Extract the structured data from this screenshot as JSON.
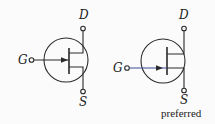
{
  "symbols": [
    {
      "id": "jfet-centered-gate",
      "terminals": {
        "drain": "D",
        "gate": "G",
        "source": "S"
      },
      "caption": ""
    },
    {
      "id": "jfet-offset-gate",
      "terminals": {
        "drain": "D",
        "gate": "G",
        "source": "S"
      },
      "caption": "preferred"
    }
  ],
  "colors": {
    "line": "#2a2a2a",
    "gate_line_right": "#3a4a9a",
    "background": "#fbfbfb"
  }
}
